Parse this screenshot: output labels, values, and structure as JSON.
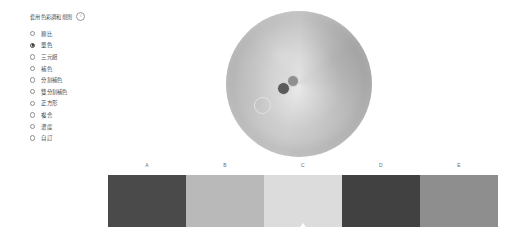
{
  "rules_panel": {
    "title": "套用色彩調和規則",
    "info_icon": "i",
    "items": [
      {
        "label": "類比",
        "selected": false
      },
      {
        "label": "單色",
        "selected": true
      },
      {
        "label": "三元組",
        "selected": false
      },
      {
        "label": "補色",
        "selected": false
      },
      {
        "label": "分割補色",
        "selected": false
      },
      {
        "label": "雙分割補色",
        "selected": false
      },
      {
        "label": "正方形",
        "selected": false
      },
      {
        "label": "複合",
        "selected": false
      },
      {
        "label": "濃度",
        "selected": false
      },
      {
        "label": "自訂",
        "selected": false
      }
    ]
  },
  "color_wheel": {
    "handles": [
      {
        "name": "handle-a",
        "style": "ring"
      },
      {
        "name": "handle-b",
        "color": "#5b5b5b"
      },
      {
        "name": "handle-c",
        "color": "#8f8f8f"
      }
    ]
  },
  "palette": {
    "swatches": [
      {
        "label": "A",
        "color": "#4a4a4a",
        "active": false
      },
      {
        "label": "B",
        "color": "#b9b9b9",
        "active": false
      },
      {
        "label": "C",
        "color": "#dcdcdc",
        "active": true
      },
      {
        "label": "D",
        "color": "#414141",
        "active": false
      },
      {
        "label": "E",
        "color": "#8e8e8e",
        "active": false
      }
    ]
  }
}
